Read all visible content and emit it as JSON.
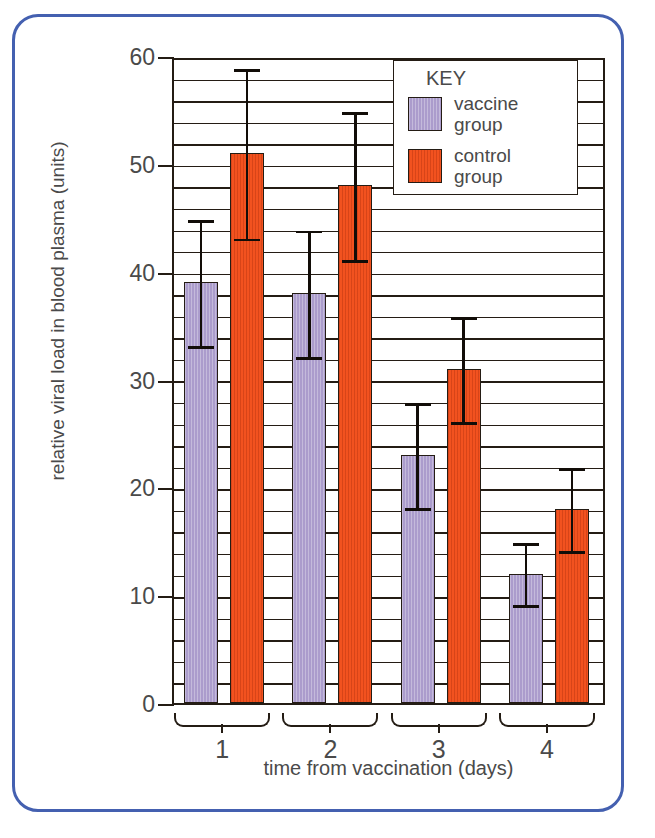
{
  "figure": {
    "border_color": "#4460b0",
    "axis_color": "#241c14"
  },
  "chart_data": {
    "type": "bar",
    "title": "",
    "subtitle": "",
    "xlabel": "time from vaccination (days)",
    "ylabel": "relative viral load in blood plasma (units)",
    "categories": [
      "1",
      "2",
      "3",
      "4"
    ],
    "ylim": [
      0,
      60
    ],
    "ytick_labels": [
      "0",
      "10",
      "20",
      "30",
      "40",
      "50",
      "60"
    ],
    "ytick_values": [
      0,
      10,
      20,
      30,
      40,
      50,
      60
    ],
    "y_minor_tick_interval": 2,
    "grid": "horizontal gridlines every 2 units",
    "legend_position": "top-right inside plot",
    "legend_title": "KEY",
    "series": [
      {
        "name": "vaccine group",
        "color": "#ab9ccc",
        "values": [
          39,
          38,
          23,
          12
        ],
        "error_low": [
          33,
          32,
          18,
          9
        ],
        "error_high": [
          45,
          44,
          28,
          15
        ]
      },
      {
        "name": "control group",
        "color": "#f2521f",
        "values": [
          51,
          48,
          31,
          18
        ],
        "error_low": [
          43,
          41,
          26,
          14
        ],
        "error_high": [
          59,
          55,
          36,
          22
        ]
      }
    ]
  }
}
